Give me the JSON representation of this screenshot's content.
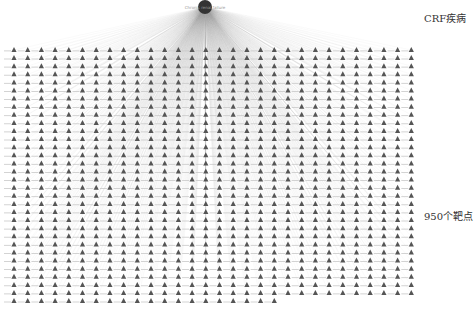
{
  "diagram": {
    "type": "network",
    "hub": {
      "label": "Chronic renal failure",
      "x": 205,
      "y": 7,
      "r": 7,
      "color": "#333333"
    },
    "targets": {
      "count": 950,
      "columns": 30,
      "rows": 32,
      "x0": 14,
      "dx": 13.7,
      "y0": 50,
      "dy": 8.1,
      "shape": "triangle",
      "color": "#555555",
      "edge_color": "#9a9a9a"
    }
  },
  "annotations": {
    "disease": "CRF疾病",
    "targets": "950个靶点"
  }
}
